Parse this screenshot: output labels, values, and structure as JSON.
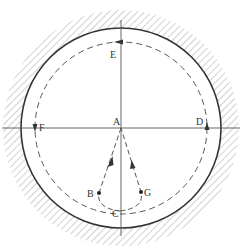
{
  "diagram": {
    "type": "physics-circular-track",
    "center": {
      "x": 121,
      "y": 128
    },
    "outer_circle_radius": 100,
    "dashed_circle_radius": 86,
    "hatch_width": 18,
    "colors": {
      "line": "#333333",
      "hatch": "#9a9a9a",
      "axis": "#555555",
      "background": "#ffffff"
    },
    "labels": {
      "A": "A",
      "B": "B",
      "C": "C",
      "D": "D",
      "E": "E",
      "F": "F",
      "G": "G"
    },
    "points": {
      "A": {
        "x": 121,
        "y": 128
      },
      "B": {
        "x": 99,
        "y": 193
      },
      "C": {
        "x": 120,
        "y": 211
      },
      "D": {
        "x": 207,
        "y": 128
      },
      "E": {
        "x": 121,
        "y": 42
      },
      "F": {
        "x": 35,
        "y": 128
      },
      "G": {
        "x": 141,
        "y": 192
      }
    }
  }
}
